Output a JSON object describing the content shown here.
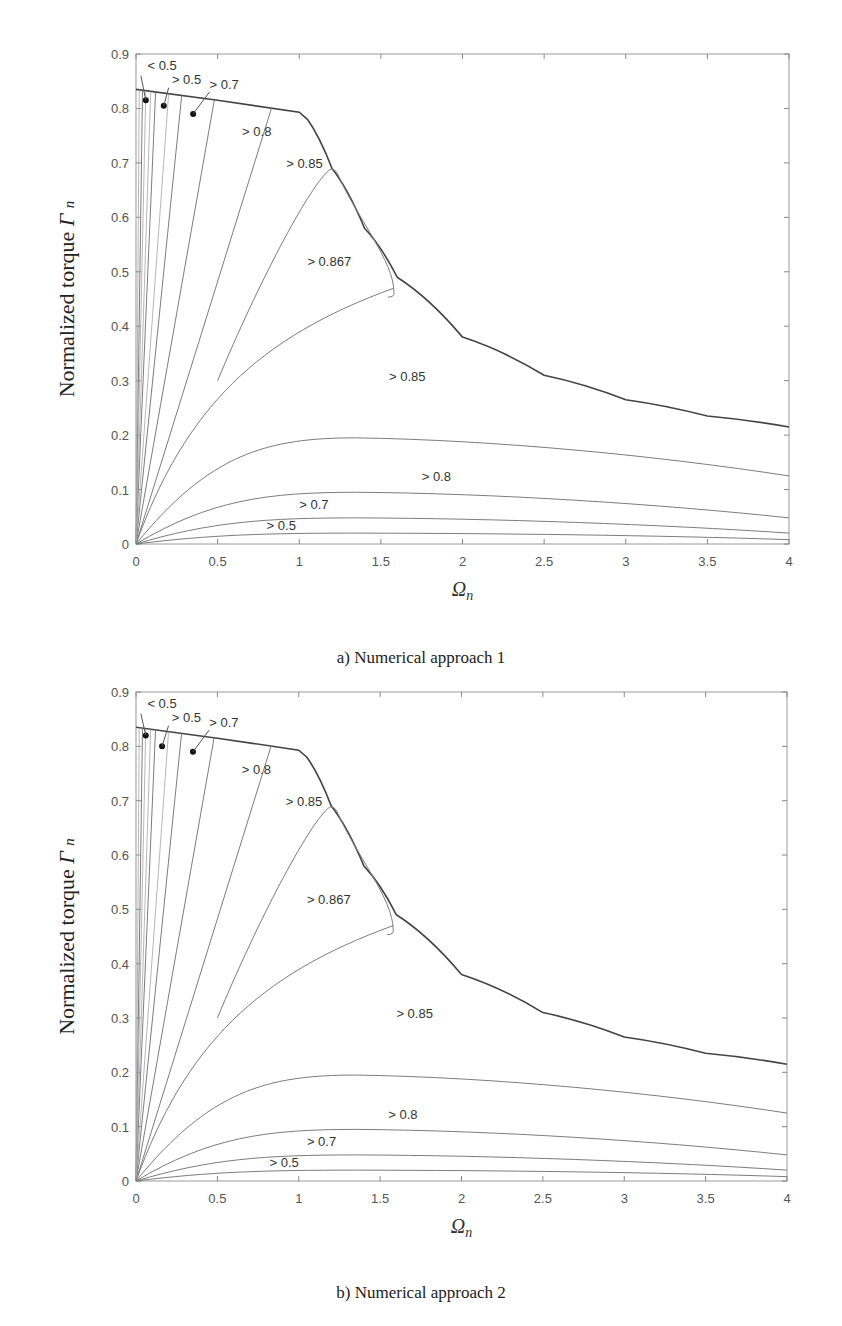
{
  "figures": [
    {
      "caption": "a) Numerical approach 1",
      "ylabel_main": "Normalized torque ",
      "ylabel_symbol": "Γ",
      "ylabel_sub": "n",
      "xlabel_symbol": "Ω",
      "xlabel_sub": "n"
    },
    {
      "caption": "b) Numerical approach 2",
      "ylabel_main": "Normalized torque ",
      "ylabel_symbol": "Γ",
      "ylabel_sub": "n",
      "xlabel_symbol": "Ω",
      "xlabel_sub": "n"
    }
  ],
  "chart_data": [
    {
      "type": "contour",
      "title": "a) Numerical approach 1",
      "xlabel": "Ω_n",
      "ylabel": "Normalized torque Γ_n",
      "xlim": [
        0,
        4
      ],
      "ylim": [
        0,
        0.9
      ],
      "xticks": [
        "0",
        "0.5",
        "1",
        "1.5",
        "2",
        "2.5",
        "3",
        "3.5",
        "4"
      ],
      "yticks": [
        "0",
        "0.1",
        "0.2",
        "0.3",
        "0.4",
        "0.5",
        "0.6",
        "0.7",
        "0.8",
        "0.9"
      ],
      "grid": false,
      "boundary_curve": {
        "x": [
          0,
          0.5,
          1.0,
          1.05,
          1.2,
          1.4,
          1.6,
          2.0,
          2.5,
          3.0,
          3.5,
          4.0
        ],
        "y": [
          0.835,
          0.815,
          0.793,
          0.78,
          0.69,
          0.58,
          0.49,
          0.38,
          0.31,
          0.265,
          0.235,
          0.215
        ]
      },
      "contour_labels": [
        {
          "text": "< 0.5",
          "x": 0.07,
          "y": 0.87
        },
        {
          "text": "> 0.5",
          "x": 0.22,
          "y": 0.845
        },
        {
          "text": "> 0.7",
          "x": 0.45,
          "y": 0.835
        },
        {
          "text": "> 0.8",
          "x": 0.65,
          "y": 0.75
        },
        {
          "text": "> 0.85",
          "x": 0.92,
          "y": 0.69
        },
        {
          "text": "> 0.867",
          "x": 1.05,
          "y": 0.51
        },
        {
          "text": "> 0.85",
          "x": 1.55,
          "y": 0.3
        },
        {
          "text": "> 0.8",
          "x": 1.75,
          "y": 0.115
        },
        {
          "text": "> 0.7",
          "x": 1.0,
          "y": 0.065
        },
        {
          "text": "> 0.5",
          "x": 0.8,
          "y": 0.025
        }
      ],
      "markers": [
        {
          "x": 0.06,
          "y": 0.815
        },
        {
          "x": 0.17,
          "y": 0.805
        },
        {
          "x": 0.35,
          "y": 0.79
        }
      ],
      "high_efficiency_island": {
        "label": "> 0.867",
        "apex": [
          1.2,
          0.69
        ],
        "right_corner": [
          1.58,
          0.47
        ],
        "peak_value": 0.867
      },
      "low_torque_contours": [
        {
          "label": "> 0.8",
          "peak_y": 0.195,
          "end_y_at_4": 0.125
        },
        {
          "label": "> 0.7",
          "peak_y": 0.095,
          "end_y_at_4": 0.048
        },
        {
          "label": "> 0.5",
          "peak_y": 0.048,
          "end_y_at_4": 0.02
        },
        {
          "label": "< 0.5",
          "peak_y": 0.02,
          "end_y_at_4": 0.008
        }
      ]
    },
    {
      "type": "contour",
      "title": "b) Numerical approach 2",
      "xlabel": "Ω_n",
      "ylabel": "Normalized torque Γ_n",
      "xlim": [
        0,
        4
      ],
      "ylim": [
        0,
        0.9
      ],
      "xticks": [
        "0",
        "0.5",
        "1",
        "1.5",
        "2",
        "2.5",
        "3",
        "3.5",
        "4"
      ],
      "yticks": [
        "0",
        "0.1",
        "0.2",
        "0.3",
        "0.4",
        "0.5",
        "0.6",
        "0.7",
        "0.8",
        "0.9"
      ],
      "grid": false,
      "boundary_curve": {
        "x": [
          0,
          0.5,
          1.0,
          1.05,
          1.2,
          1.4,
          1.6,
          2.0,
          2.5,
          3.0,
          3.5,
          4.0
        ],
        "y": [
          0.835,
          0.815,
          0.793,
          0.78,
          0.69,
          0.58,
          0.49,
          0.38,
          0.31,
          0.265,
          0.235,
          0.215
        ]
      },
      "contour_labels": [
        {
          "text": "< 0.5",
          "x": 0.07,
          "y": 0.87
        },
        {
          "text": "> 0.5",
          "x": 0.22,
          "y": 0.845
        },
        {
          "text": "> 0.7",
          "x": 0.45,
          "y": 0.835
        },
        {
          "text": "> 0.8",
          "x": 0.65,
          "y": 0.75
        },
        {
          "text": "> 0.85",
          "x": 0.92,
          "y": 0.69
        },
        {
          "text": "> 0.867",
          "x": 1.05,
          "y": 0.51
        },
        {
          "text": "> 0.85",
          "x": 1.6,
          "y": 0.3
        },
        {
          "text": "> 0.8",
          "x": 1.55,
          "y": 0.115
        },
        {
          "text": "> 0.7",
          "x": 1.05,
          "y": 0.065
        },
        {
          "text": "> 0.5",
          "x": 0.82,
          "y": 0.025
        }
      ],
      "markers": [
        {
          "x": 0.06,
          "y": 0.82
        },
        {
          "x": 0.16,
          "y": 0.8
        },
        {
          "x": 0.35,
          "y": 0.79
        }
      ],
      "high_efficiency_island": {
        "label": "> 0.867",
        "apex": [
          1.2,
          0.69
        ],
        "right_corner": [
          1.58,
          0.47
        ],
        "peak_value": 0.867
      },
      "low_torque_contours": [
        {
          "label": "> 0.8",
          "peak_y": 0.195,
          "end_y_at_4": 0.125
        },
        {
          "label": "> 0.7",
          "peak_y": 0.095,
          "end_y_at_4": 0.048
        },
        {
          "label": "> 0.5",
          "peak_y": 0.048,
          "end_y_at_4": 0.02
        },
        {
          "label": "< 0.5",
          "peak_y": 0.02,
          "end_y_at_4": 0.008
        }
      ]
    }
  ]
}
